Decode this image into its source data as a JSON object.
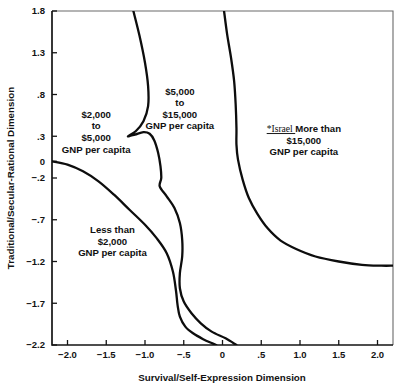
{
  "chart_data": {
    "type": "line",
    "title": "",
    "xlabel": "Survival/Self-Expression Dimension",
    "ylabel": "Traditional/Secular-Rational Dimension",
    "xlim": [
      -2.2,
      2.2
    ],
    "ylim": [
      -2.2,
      1.8
    ],
    "grid": false,
    "legend": "none",
    "xticks": [
      "-2.0",
      "-1.5",
      "-1.0",
      "-.5",
      "0",
      ".5",
      "1.0",
      "1.5",
      "2.0"
    ],
    "xtick_values": [
      -2.0,
      -1.5,
      -1.0,
      -0.5,
      0,
      0.5,
      1.0,
      1.5,
      2.0
    ],
    "yticks": [
      "1.8",
      "1.3",
      ".8",
      ".3",
      "0",
      "-.2",
      "-.7",
      "-1.2",
      "-1.7",
      "-2.2"
    ],
    "ytick_values": [
      1.8,
      1.3,
      0.8,
      0.3,
      0,
      -0.2,
      -0.7,
      -1.2,
      -1.7,
      -2.2
    ],
    "series": [
      {
        "name": "boundary-less-than-2000",
        "description": "Lower-left boundary separating 'Less than $2,000' region; starts at left axis at y=0 and sweeps down-right to exit bottom axis near x=-0.1",
        "points": [
          [
            -2.2,
            0.0
          ],
          [
            -2.0,
            -0.04
          ],
          [
            -1.8,
            -0.12
          ],
          [
            -1.6,
            -0.24
          ],
          [
            -1.4,
            -0.4
          ],
          [
            -1.2,
            -0.58
          ],
          [
            -1.0,
            -0.76
          ],
          [
            -0.85,
            -0.92
          ],
          [
            -0.72,
            -1.1
          ],
          [
            -0.64,
            -1.32
          ],
          [
            -0.6,
            -1.55
          ],
          [
            -0.58,
            -1.72
          ],
          [
            -0.55,
            -1.86
          ],
          [
            -0.48,
            -1.98
          ],
          [
            -0.38,
            -2.06
          ],
          [
            -0.25,
            -2.13
          ],
          [
            -0.13,
            -2.18
          ],
          [
            -0.08,
            -2.2
          ]
        ]
      },
      {
        "name": "boundary-2000-to-5000",
        "description": "Boundary separating '$2,000 to $5,000' region from '$5,000 to $15,000'; enters from top axis near x=-1.15, bulges right, pinches at y=0.30 and descends to exit the bottom axis near x=0.2",
        "points": [
          [
            -1.15,
            1.8
          ],
          [
            -1.07,
            1.5
          ],
          [
            -1.0,
            1.18
          ],
          [
            -0.96,
            0.9
          ],
          [
            -0.96,
            0.66
          ],
          [
            -1.02,
            0.48
          ],
          [
            -1.12,
            0.36
          ],
          [
            -1.22,
            0.3
          ],
          [
            -1.13,
            0.32
          ],
          [
            -1.02,
            0.35
          ],
          [
            -0.94,
            0.33
          ],
          [
            -0.88,
            0.25
          ],
          [
            -0.83,
            0.1
          ],
          [
            -0.8,
            -0.06
          ],
          [
            -0.79,
            -0.2
          ],
          [
            -0.81,
            -0.3
          ],
          [
            -0.72,
            -0.42
          ],
          [
            -0.62,
            -0.56
          ],
          [
            -0.55,
            -0.74
          ],
          [
            -0.52,
            -0.94
          ],
          [
            -0.52,
            -1.14
          ],
          [
            -0.55,
            -1.34
          ],
          [
            -0.55,
            -1.52
          ],
          [
            -0.5,
            -1.68
          ],
          [
            -0.4,
            -1.82
          ],
          [
            -0.28,
            -1.94
          ],
          [
            -0.14,
            -2.04
          ],
          [
            0.04,
            -2.12
          ],
          [
            0.18,
            -2.2
          ]
        ]
      },
      {
        "name": "boundary-more-than-15000",
        "description": "Boundary enclosing the 'More than $15,000' region in the upper-right; enters top axis near x=0.02, bows left to about x=0.17 at y=0.3 then curves down-right and flattens to meet the right axis at y=-1.25",
        "points": [
          [
            0.02,
            1.8
          ],
          [
            0.06,
            1.52
          ],
          [
            0.11,
            1.24
          ],
          [
            0.15,
            0.96
          ],
          [
            0.17,
            0.68
          ],
          [
            0.18,
            0.4
          ],
          [
            0.18,
            0.2
          ],
          [
            0.2,
            0.02
          ],
          [
            0.26,
            -0.22
          ],
          [
            0.34,
            -0.44
          ],
          [
            0.45,
            -0.63
          ],
          [
            0.58,
            -0.8
          ],
          [
            0.75,
            -0.95
          ],
          [
            0.95,
            -1.05
          ],
          [
            1.2,
            -1.14
          ],
          [
            1.5,
            -1.2
          ],
          [
            1.8,
            -1.24
          ],
          [
            2.05,
            -1.25
          ],
          [
            2.2,
            -1.25
          ]
        ]
      }
    ],
    "annotations": [
      {
        "name": "region-2000-to-5000",
        "lines": [
          "$2,000",
          "to",
          "$5,000",
          "GNP per capita"
        ],
        "x": -1.63,
        "y": 0.52
      },
      {
        "name": "region-5000-to-15000",
        "lines": [
          "$5,000",
          "to",
          "$15,000",
          "GNP per capita"
        ],
        "x": -0.55,
        "y": 0.8
      },
      {
        "name": "region-more-than-15000",
        "prefix": "*Israel",
        "lines": [
          "More than",
          "$15,000",
          "GNP per capita"
        ],
        "x": 1.05,
        "y": 0.35
      },
      {
        "name": "region-less-than-2000",
        "lines": [
          "Less than",
          "$2,000",
          "GNP per capita"
        ],
        "x": -1.42,
        "y": -0.86
      }
    ],
    "colors": {
      "curve": "#0d0d0d",
      "axis": "#141414",
      "frame": "#6a6a6a",
      "text": "#101010",
      "background": "#ffffff"
    }
  }
}
